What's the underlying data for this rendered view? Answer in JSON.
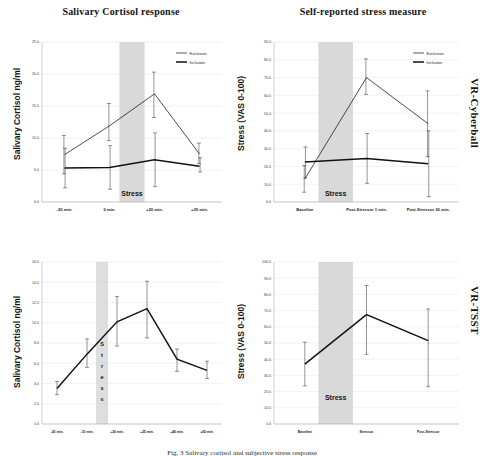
{
  "figure": {
    "caption": "Fig. 3  Salivary cortisol and subjective stress response",
    "row_labels": [
      "VR-Cyberball",
      "VR-TSST"
    ]
  },
  "legend": {
    "items": [
      {
        "label": "Exclusion",
        "color": "#111111",
        "width": "thin"
      },
      {
        "label": "Inclusion",
        "color": "#111111",
        "width": "thick"
      }
    ]
  },
  "stress_band_label": "Stress",
  "stress_band_label_vertical": [
    "S",
    "t",
    "r",
    "e",
    "s",
    "s"
  ],
  "chart_data": [
    {
      "id": "cyberball-cortisol",
      "type": "line",
      "title": "Salivary  Cortisol response",
      "ylabel": "Salivary Cortisol ng/ml",
      "xlabel": "",
      "side_label": "VR-Cyberball",
      "categories": [
        "-20 min.",
        "0 min.",
        "+20 min.",
        "+35 min."
      ],
      "yticks": [
        "0.0",
        "5.0",
        "10.0",
        "15.0",
        "20.0",
        "25.0"
      ],
      "ylim": [
        0.0,
        25.0
      ],
      "grid": true,
      "legend_position": "top-right",
      "stress_band": {
        "from_index": 1,
        "to_index": 2,
        "label": "Stress"
      },
      "series": [
        {
          "name": "Exclusion",
          "values": [
            7.4,
            11.9,
            16.9,
            7.5
          ],
          "err_low": [
            4.4,
            9.6,
            13.2,
            6.0
          ],
          "err_high": [
            10.4,
            15.4,
            20.3,
            9.2
          ]
        },
        {
          "name": "Inclusion",
          "values": [
            5.3,
            5.4,
            6.6,
            5.6
          ],
          "err_low": [
            2.2,
            2.0,
            2.4,
            4.7
          ],
          "err_high": [
            8.4,
            8.8,
            10.8,
            6.9
          ]
        }
      ]
    },
    {
      "id": "cyberball-stress",
      "type": "line",
      "title": "Self-reported stress measure",
      "ylabel": "Stress (VAS 0-100)",
      "xlabel": "",
      "side_label": "VR-Cyberball",
      "categories": [
        "Baseline",
        "Post-Stressor 1 min.",
        "Post-Stressor 30 min."
      ],
      "yticks": [
        "0.0",
        "10.0",
        "20.0",
        "30.0",
        "40.0",
        "50.0",
        "60.0",
        "70.0",
        "80.0",
        "90.0"
      ],
      "ylim": [
        0.0,
        90.0
      ],
      "grid": true,
      "legend_position": "top-right",
      "stress_band": {
        "from_index": 0,
        "to_index": 1,
        "label": "Stress"
      },
      "series": [
        {
          "name": "Exclusion",
          "values": [
            13.0,
            70.0,
            44.0
          ],
          "err_low": [
            5.5,
            60.5,
            25.5
          ],
          "err_high": [
            20.5,
            80.5,
            62.5
          ]
        },
        {
          "name": "Inclusion",
          "values": [
            22.5,
            24.5,
            21.5
          ],
          "err_low": [
            13.5,
            10.5,
            3.0
          ],
          "err_high": [
            31.0,
            38.5,
            40.0
          ]
        }
      ]
    },
    {
      "id": "tsst-cortisol",
      "type": "line",
      "title": "",
      "ylabel": "Salivary Cortisol ng/ml",
      "xlabel": "",
      "side_label": "VR-TSST",
      "categories": [
        "-20 min.",
        "-10 min.",
        "+20 min.",
        "+25 min.",
        "+40 min.",
        "+60 min."
      ],
      "yticks": [
        "0.0",
        "2.0",
        "4.0",
        "6.0",
        "8.0",
        "10.0",
        "12.0",
        "14.0",
        "16.0"
      ],
      "ylim": [
        0.0,
        16.0
      ],
      "grid": true,
      "legend_position": "none",
      "stress_band": {
        "from_index": 1,
        "to_index": 2,
        "label": "Stress"
      },
      "series": [
        {
          "name": "Cortisol",
          "values": [
            3.5,
            6.9,
            10.1,
            11.4,
            6.4,
            5.3
          ],
          "err_low": [
            2.9,
            5.6,
            7.7,
            8.5,
            5.2,
            4.5
          ],
          "err_high": [
            4.2,
            8.4,
            12.6,
            14.1,
            7.4,
            6.2
          ]
        }
      ]
    },
    {
      "id": "tsst-stress",
      "type": "line",
      "title": "",
      "ylabel": "Stress (VAS 0-100)",
      "xlabel": "",
      "side_label": "VR-TSST",
      "categories": [
        "Baseline",
        "Stressor",
        "Post-Stressor"
      ],
      "yticks": [
        "0.0",
        "10.0",
        "20.0",
        "30.0",
        "40.0",
        "50.0",
        "60.0",
        "70.0",
        "80.0",
        "90.0",
        "100.0"
      ],
      "ylim": [
        0.0,
        100.0
      ],
      "grid": true,
      "legend_position": "none",
      "stress_band": {
        "from_index": 0,
        "to_index": 1,
        "label": "Stress"
      },
      "series": [
        {
          "name": "Stress",
          "values": [
            37.0,
            67.5,
            51.5
          ],
          "err_low": [
            23.5,
            43.0,
            23.0
          ],
          "err_high": [
            50.5,
            85.5,
            71.0
          ]
        }
      ]
    }
  ]
}
